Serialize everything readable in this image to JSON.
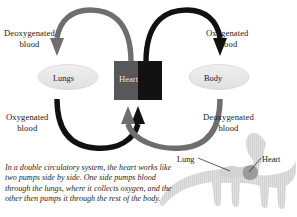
{
  "diagram": {
    "title": "Double circulatory system",
    "nodes": [
      {
        "id": "lungs",
        "label": "Lungs",
        "shape": "ellipse",
        "fill": "#e8e8e8"
      },
      {
        "id": "heart",
        "label": "Heart",
        "shape": "rect",
        "fill_left": "#585858",
        "fill_right": "#121212"
      },
      {
        "id": "body",
        "label": "Body",
        "shape": "ellipse",
        "fill": "#e8e8e8"
      }
    ],
    "arrow_labels": {
      "top_left": "Deoxygenated\nblood",
      "top_left_line1": "Deoxygenated",
      "top_left_line2": "blood",
      "top_right_line1": "Oxygenated",
      "top_right_line2": "blood",
      "bottom_left_line1": "Oxygenated",
      "bottom_left_line2": "blood",
      "bottom_right_line1": "Deoxygenated",
      "bottom_right_line2": "blood"
    },
    "arrows": [
      {
        "id": "heart-to-lungs",
        "from": "heart",
        "to": "lungs",
        "color": "#6e6e6e",
        "label": "Deoxygenated blood"
      },
      {
        "id": "heart-to-body",
        "from": "heart",
        "to": "body",
        "color": "#111111",
        "label": "Oxygenated blood"
      },
      {
        "id": "lungs-to-heart",
        "from": "lungs",
        "to": "heart",
        "color": "#111111",
        "label": "Oxygenated blood"
      },
      {
        "id": "body-to-heart",
        "from": "body",
        "to": "heart",
        "color": "#6e6e6e",
        "label": "Deoxygenated blood"
      }
    ],
    "colors": {
      "deoxygenated": "#6e6e6e",
      "oxygenated": "#111111",
      "node_fill": "#e8e8e8",
      "dino_fill": "#d9d9d9",
      "dino_organ": "#9a9a9a"
    }
  },
  "dinosaur": {
    "name": "sauropod-silhouette",
    "labels": {
      "lung": "Lung",
      "heart": "Heart"
    }
  },
  "caption": {
    "text": "In a double circulatory system, the heart works like two pumps side by side. One side pumps blood through the lungs, where it collects oxygen, and the other then pumps it through the rest of the body."
  }
}
